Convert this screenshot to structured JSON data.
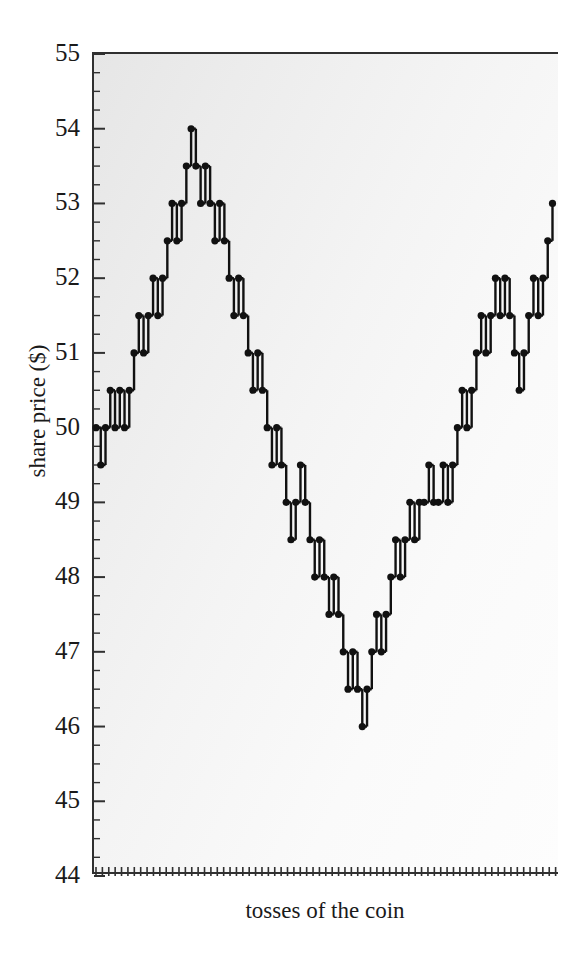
{
  "chart_data": {
    "type": "line",
    "title": "",
    "subtitle": "",
    "xlabel": "tosses of the coin",
    "ylabel": "share price ($)",
    "ylim": [
      44,
      55
    ],
    "xlim": [
      0,
      72
    ],
    "ytick_labels": [
      "55",
      "54",
      "53",
      "52",
      "51",
      "50",
      "49",
      "48",
      "47",
      "46",
      "45",
      "44"
    ],
    "ytick_values": [
      55,
      54,
      53,
      52,
      51,
      50,
      49,
      48,
      47,
      46,
      45,
      44
    ],
    "yminor_step": 0.25,
    "xtick_labels": [],
    "xtick_count": 72,
    "grid": false,
    "legend": false,
    "marker": "filled-circle",
    "series_name": "share price random walk",
    "step_size": 0.5,
    "x": [
      0,
      1,
      2,
      3,
      4,
      5,
      6,
      7,
      8,
      9,
      10,
      11,
      12,
      13,
      14,
      15,
      16,
      17,
      18,
      19,
      20,
      21,
      22,
      23,
      24,
      25,
      26,
      27,
      28,
      29,
      30,
      31,
      32,
      33,
      34,
      35,
      36,
      37,
      38,
      39,
      40,
      41,
      42,
      43,
      44,
      45,
      46,
      47,
      48,
      49,
      50,
      51,
      52,
      53,
      54,
      55,
      56,
      57,
      58,
      59,
      60,
      61,
      62,
      63,
      64,
      65,
      66,
      67,
      68,
      69,
      70,
      71
    ],
    "values": [
      50,
      49.5,
      50,
      50.5,
      50,
      50.5,
      50,
      50.5,
      51,
      51.5,
      51,
      51.5,
      52,
      51.5,
      52,
      52.5,
      53,
      52.5,
      53,
      53.5,
      54,
      53.5,
      53,
      53.5,
      53,
      52.5,
      53,
      52.5,
      52,
      51.5,
      52,
      51.5,
      51,
      50.5,
      51,
      50.5,
      50,
      49.5,
      50,
      49.5,
      49,
      48.5,
      49,
      49.5,
      49,
      48.5,
      48,
      48.5,
      48,
      47.5,
      48,
      47.5,
      47,
      46.5,
      47,
      46.5,
      46,
      46.5,
      47,
      47.5,
      47,
      47.5,
      48,
      48.5,
      48,
      48.5,
      49,
      48.5,
      49,
      49,
      49.5,
      49
    ],
    "values_tail": [
      49,
      49.5,
      49,
      49.5,
      50,
      50.5,
      50,
      50.5,
      51,
      51.5,
      51,
      51.5,
      52,
      51.5,
      52,
      51.5,
      51,
      50.5,
      51,
      51.5,
      52,
      51.5,
      52,
      52.5,
      53
    ],
    "colors": {
      "line": "#111111",
      "marker": "#111111",
      "axis": "#303030",
      "plot_bg": "#f0f0f0",
      "page_bg": "#ffffff",
      "text": "#1a1a1a"
    }
  }
}
